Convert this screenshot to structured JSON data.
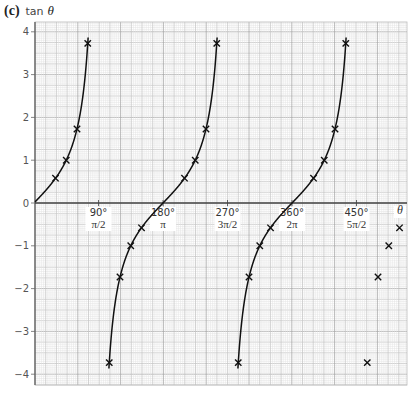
{
  "chart_data": {
    "type": "line",
    "part_label": "(c)",
    "function_label": "tan",
    "variable_label": "θ",
    "xlabel": "θ",
    "ylabel": "tan θ",
    "xlim": [
      0,
      500
    ],
    "ylim": [
      -4.25,
      4.25
    ],
    "grid": true,
    "y_ticks": [
      4,
      3,
      2,
      1,
      0,
      -1,
      -2,
      -3,
      -4
    ],
    "y_tick_labels": [
      "4",
      "3",
      "2",
      "1",
      "0",
      "−1",
      "−2",
      "−3",
      "−4"
    ],
    "x_ticks": [
      {
        "deg": 90,
        "label": "90°",
        "rad_label": "π/2"
      },
      {
        "deg": 180,
        "label": "180°",
        "rad_label": "π"
      },
      {
        "deg": 270,
        "label": "270°",
        "rad_label": "3π/2"
      },
      {
        "deg": 360,
        "label": "360°",
        "rad_label": "2π"
      },
      {
        "deg": 450,
        "label": "450°",
        "rad_label": "5π/2"
      }
    ],
    "series": [
      {
        "name": "tan θ",
        "marker": "x",
        "points": [
          {
            "x": 30,
            "y": 0.58
          },
          {
            "x": 45,
            "y": 1.0
          },
          {
            "x": 60,
            "y": 1.73
          },
          {
            "x": 75,
            "y": 3.73
          },
          {
            "x": 105,
            "y": -3.73
          },
          {
            "x": 120,
            "y": -1.73
          },
          {
            "x": 135,
            "y": -1.0
          },
          {
            "x": 150,
            "y": -0.58
          },
          {
            "x": 210,
            "y": 0.58
          },
          {
            "x": 225,
            "y": 1.0
          },
          {
            "x": 240,
            "y": 1.73
          },
          {
            "x": 255,
            "y": 3.73
          },
          {
            "x": 285,
            "y": -3.73
          },
          {
            "x": 300,
            "y": -1.73
          },
          {
            "x": 315,
            "y": -1.0
          },
          {
            "x": 330,
            "y": -0.58
          },
          {
            "x": 390,
            "y": 0.58
          },
          {
            "x": 405,
            "y": 1.0
          },
          {
            "x": 420,
            "y": 1.73
          },
          {
            "x": 435,
            "y": 3.73
          },
          {
            "x": 465,
            "y": -3.73
          },
          {
            "x": 480,
            "y": -1.73
          },
          {
            "x": 495,
            "y": -1.0
          },
          {
            "x": 510,
            "y": -0.58
          }
        ]
      }
    ],
    "colors": {
      "curve": "#111111",
      "grid_fine": "#e2e2e2",
      "grid_mid": "#c8c8c8",
      "grid_major": "#a8a8a8",
      "axis": "#444444"
    }
  }
}
